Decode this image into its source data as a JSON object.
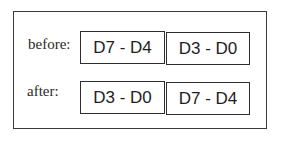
{
  "diagram": {
    "rows": [
      {
        "label": "before:",
        "cells": [
          "D7 - D4",
          "D3 - D0"
        ]
      },
      {
        "label": "after:",
        "cells": [
          "D3 - D0",
          "D7 - D4"
        ]
      }
    ]
  }
}
